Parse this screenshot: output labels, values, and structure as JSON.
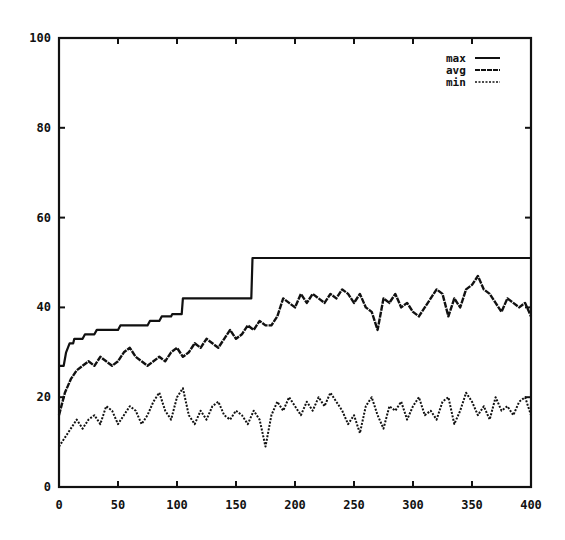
{
  "chart_data": {
    "type": "line",
    "title": "",
    "xlabel": "",
    "ylabel": "",
    "xlim": [
      0,
      400
    ],
    "ylim": [
      0,
      100
    ],
    "grid": false,
    "legend_position": "top-right",
    "x_ticks": [
      0,
      50,
      100,
      150,
      200,
      250,
      300,
      350,
      400
    ],
    "y_ticks": [
      0,
      20,
      40,
      60,
      80,
      100
    ],
    "x": [
      0,
      5,
      10,
      15,
      20,
      25,
      30,
      35,
      40,
      45,
      50,
      55,
      60,
      65,
      70,
      75,
      80,
      85,
      90,
      95,
      100,
      105,
      110,
      115,
      120,
      125,
      130,
      135,
      140,
      145,
      150,
      155,
      160,
      165,
      170,
      175,
      180,
      185,
      190,
      195,
      200,
      205,
      210,
      215,
      220,
      225,
      230,
      235,
      240,
      245,
      250,
      255,
      260,
      265,
      270,
      275,
      280,
      285,
      290,
      295,
      300,
      305,
      310,
      315,
      320,
      325,
      330,
      335,
      340,
      345,
      350,
      355,
      360,
      365,
      370,
      375,
      380,
      385,
      390,
      395,
      400
    ],
    "series": [
      {
        "name": "max",
        "style": "solid",
        "step_points": [
          [
            0,
            27
          ],
          [
            4,
            27
          ],
          [
            6,
            30
          ],
          [
            9,
            32
          ],
          [
            12,
            32
          ],
          [
            13,
            33
          ],
          [
            20,
            33
          ],
          [
            22,
            34
          ],
          [
            30,
            34
          ],
          [
            32,
            35
          ],
          [
            50,
            35
          ],
          [
            52,
            36
          ],
          [
            75,
            36
          ],
          [
            77,
            37
          ],
          [
            85,
            37
          ],
          [
            87,
            38
          ],
          [
            95,
            38
          ],
          [
            96,
            38.5
          ],
          [
            104,
            38.5
          ],
          [
            105,
            42
          ],
          [
            163,
            42
          ],
          [
            164,
            51
          ],
          [
            400,
            51
          ]
        ]
      },
      {
        "name": "avg",
        "style": "long-dash",
        "values": [
          16,
          21,
          24,
          26,
          27,
          28,
          27,
          29,
          28,
          27,
          28,
          30,
          31,
          29,
          28,
          27,
          28,
          29,
          28,
          30,
          31,
          29,
          30,
          32,
          31,
          33,
          32,
          31,
          33,
          35,
          33,
          34,
          36,
          35,
          37,
          36,
          36,
          38,
          42,
          41,
          40,
          43,
          41,
          43,
          42,
          41,
          43,
          42,
          44,
          43,
          41,
          43,
          40,
          39,
          35,
          42,
          41,
          43,
          40,
          41,
          39,
          38,
          40,
          42,
          44,
          43,
          38,
          42,
          40,
          44,
          45,
          47,
          44,
          43,
          41,
          39,
          42,
          41,
          40,
          41,
          38
        ]
      },
      {
        "name": "min",
        "style": "dotted",
        "values": [
          9,
          11,
          13,
          15,
          13,
          15,
          16,
          14,
          18,
          17,
          14,
          16,
          18,
          17,
          14,
          16,
          19,
          21,
          17,
          15,
          20,
          22,
          16,
          14,
          17,
          15,
          18,
          19,
          16,
          15,
          17,
          16,
          14,
          17,
          15,
          9,
          16,
          19,
          17,
          20,
          18,
          16,
          19,
          17,
          20,
          18,
          21,
          19,
          17,
          14,
          16,
          12,
          18,
          20,
          16,
          13,
          18,
          17,
          19,
          15,
          18,
          20,
          16,
          17,
          15,
          19,
          20,
          14,
          17,
          21,
          19,
          16,
          18,
          15,
          20,
          17,
          18,
          16,
          19,
          20,
          16
        ]
      }
    ]
  },
  "legend": {
    "items": [
      {
        "label": "max",
        "style": "solid"
      },
      {
        "label": "avg",
        "style": "long-dash"
      },
      {
        "label": "min",
        "style": "dotted"
      }
    ]
  },
  "colors": {
    "line": "#111111",
    "background": "#ffffff",
    "axis": "#111111"
  }
}
